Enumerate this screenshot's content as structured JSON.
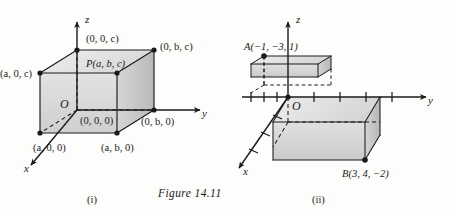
{
  "figure": {
    "caption": "Figure 14.11",
    "panels": [
      {
        "id": "panel-i",
        "sub_caption": "(i)",
        "axes": {
          "x": "x",
          "y": "y",
          "z": "z",
          "origin": "O"
        },
        "labels": {
          "origin_coord": "(0, 0, 0)",
          "z_vertex": "(0, 0, c)",
          "top_back_right": "(0, b, c)",
          "top_front_left": "(a, 0, c)",
          "point_p": "P(a, b, c)",
          "x_vertex": "(a, 0, 0)",
          "bottom_front_right": "(a, b, 0)",
          "y_vertex": "(0, b, 0)"
        }
      },
      {
        "id": "panel-ii",
        "sub_caption": "(ii)",
        "axes": {
          "x": "x",
          "y": "y",
          "z": "z",
          "origin": "O"
        },
        "labels": {
          "point_a": "A(−1, −3, 1)",
          "point_b": "B(3, 4, −2)"
        },
        "ticks": {
          "y_negative": 3,
          "y_positive": 4,
          "x": 3
        }
      }
    ]
  },
  "colors": {
    "background": "#fdfdfc",
    "ink": "#1a1a1a",
    "box_face_light": "#e4e4e4",
    "box_face_mid": "#d2d2d2",
    "box_face_dark": "#c0c0c0"
  }
}
